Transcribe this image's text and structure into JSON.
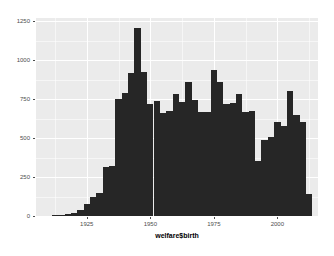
{
  "chart_data": {
    "type": "bar",
    "title": "",
    "subtitle": "",
    "xlabel": "welfare$birth",
    "ylabel": "",
    "xlim": [
      1905,
      2016
    ],
    "ylim": [
      0,
      1270
    ],
    "grid": true,
    "legend_position": "none",
    "bar_color": "#262626",
    "panel_color": "#ebebeb",
    "gridline_color": "#ffffff",
    "binwidth": 2.5,
    "x_ticks": [
      1925,
      1950,
      1975,
      2000
    ],
    "x_tick_labels": [
      "1925",
      "1950",
      "1975",
      "2000"
    ],
    "y_ticks": [
      0,
      250,
      500,
      750,
      1000,
      1250
    ],
    "y_tick_labels": [
      "0",
      "250",
      "500",
      "750",
      "1000",
      "1250"
    ],
    "x_minor_ticks": [
      1912.5,
      1937.5,
      1962.5,
      1987.5,
      2012.5
    ],
    "y_minor_ticks": [
      125,
      375,
      625,
      875,
      1125
    ],
    "categories": [
      1907.5,
      1910.0,
      1912.5,
      1915.0,
      1917.5,
      1920.0,
      1922.5,
      1925.0,
      1927.5,
      1930.0,
      1932.5,
      1935.0,
      1937.5,
      1940.0,
      1942.5,
      1945.0,
      1947.5,
      1950.0,
      1952.5,
      1955.0,
      1957.5,
      1960.0,
      1962.5,
      1965.0,
      1967.5,
      1970.0,
      1972.5,
      1975.0,
      1977.5,
      1980.0,
      1982.5,
      1985.0,
      1987.5,
      1990.0,
      1992.5,
      1995.0,
      1997.5,
      2000.0,
      2002.5,
      2005.0,
      2007.5,
      2010.0,
      2012.5
    ],
    "values": [
      2,
      3,
      5,
      8,
      14,
      22,
      40,
      75,
      120,
      150,
      315,
      320,
      750,
      790,
      920,
      1205,
      925,
      720,
      740,
      660,
      675,
      780,
      730,
      860,
      745,
      665,
      670,
      935,
      860,
      720,
      725,
      780,
      670,
      675,
      350,
      490,
      510,
      600,
      575,
      800,
      645,
      600,
      140
    ],
    "series": [
      {
        "name": "count",
        "values": [
          2,
          3,
          5,
          8,
          14,
          22,
          40,
          75,
          120,
          150,
          315,
          320,
          750,
          790,
          920,
          1205,
          925,
          720,
          740,
          660,
          675,
          780,
          730,
          860,
          745,
          665,
          670,
          935,
          860,
          720,
          725,
          780,
          670,
          675,
          350,
          490,
          510,
          600,
          575,
          800,
          645,
          600,
          140
        ]
      }
    ]
  }
}
